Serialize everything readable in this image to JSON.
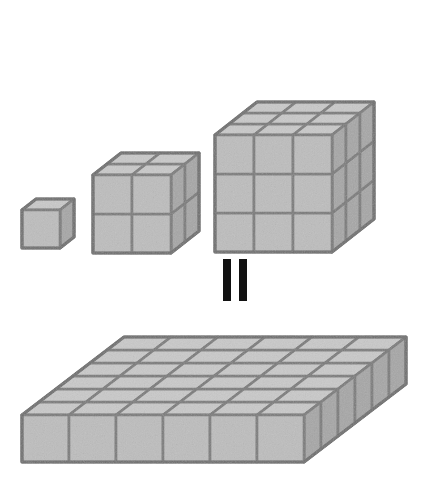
{
  "figure": {
    "identity": "1³ + 2³ + 3³ = 6²",
    "equals_symbol": "=",
    "equals_symbol_orientation": "vertical-double-bar",
    "background_color": "#ffffff"
  },
  "palette": {
    "face_front": "#bdbdbd",
    "face_top": "#c9c9c9",
    "face_side": "#a6a6a6",
    "edge": "#7a7a7a",
    "edge_outer": "#6e6e6e",
    "equals_bar": "#111111"
  },
  "geometry": {
    "unit_px": 39,
    "iso_dx": 14,
    "iso_dy": -11
  },
  "top_group": {
    "label": "stair-step stack of cubes",
    "stacks": [
      {
        "name": "cube-1",
        "size_label": "1 × 1 × 1",
        "n": 1,
        "cube_count": 1,
        "origin_x": 22,
        "origin_y": 248,
        "unit": 38
      },
      {
        "name": "cube-2",
        "size_label": "2 × 2 × 2",
        "n": 2,
        "cube_count": 8,
        "origin_x": 93,
        "origin_y": 253,
        "unit": 39
      },
      {
        "name": "cube-3",
        "size_label": "3 × 3 × 3",
        "n": 3,
        "cube_count": 27,
        "origin_x": 215,
        "origin_y": 252,
        "unit": 39
      }
    ],
    "total_cubes": 36
  },
  "bottom_group": {
    "label": "flat square slab",
    "name": "slab-6x6x1",
    "size_label": "6 × 6 × 1",
    "columns": 6,
    "rows": 6,
    "height": 1,
    "cube_count": 36,
    "origin_x": 22,
    "origin_y": 462,
    "unit": 47,
    "iso_dx": 17,
    "iso_dy": -13
  },
  "chart_data": {
    "type": "bar",
    "title": "1³ + 2³ + 3³ = 6²",
    "categories": [
      "1³",
      "2³",
      "3³",
      "6²"
    ],
    "values": [
      1,
      8,
      27,
      36
    ],
    "xlabel": "",
    "ylabel": "cube count",
    "ylim": [
      0,
      36
    ]
  }
}
